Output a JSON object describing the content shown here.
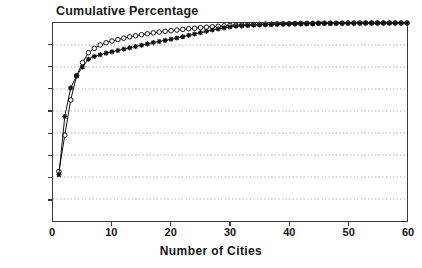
{
  "chart_data": {
    "type": "line",
    "title": "Cumulative Percentage",
    "xlabel": "Number of Cities",
    "ylabel": "",
    "xlim": [
      0,
      60
    ],
    "ylim": [
      10,
      100
    ],
    "grid": true,
    "legend_position": "none",
    "x_ticks": [
      0,
      10,
      20,
      30,
      40,
      50,
      60
    ],
    "x_tick_labels": [
      "0",
      "10",
      "20",
      "30",
      "40",
      "50",
      "60"
    ],
    "y_ticks": [
      10,
      20,
      30,
      40,
      50,
      60,
      70,
      80,
      90,
      100
    ],
    "y_tick_labels": [
      "10%",
      "20%",
      "30%",
      "40%",
      "50%",
      "60%",
      "70%",
      "80%",
      "90%",
      "100%"
    ],
    "x": [
      1,
      2,
      3,
      4,
      5,
      6,
      7,
      8,
      9,
      10,
      11,
      12,
      13,
      14,
      15,
      16,
      17,
      18,
      19,
      20,
      21,
      22,
      23,
      24,
      25,
      26,
      27,
      28,
      29,
      30,
      31,
      32,
      33,
      34,
      35,
      36,
      37,
      38,
      39,
      40,
      41,
      42,
      43,
      44,
      45,
      46,
      47,
      48,
      49,
      50,
      51,
      52,
      53,
      54,
      55,
      56,
      57,
      58,
      59,
      60
    ],
    "series": [
      {
        "name": "series-circles",
        "marker": "open-circle",
        "color": "#111111",
        "values": [
          32.5,
          49.0,
          65.0,
          76.0,
          82.0,
          86.5,
          88.5,
          90.0,
          91.0,
          91.8,
          92.5,
          93.1,
          93.7,
          94.2,
          94.7,
          95.1,
          95.5,
          95.9,
          96.2,
          96.5,
          96.8,
          97.1,
          97.4,
          97.6,
          97.9,
          98.1,
          98.3,
          98.5,
          98.7,
          98.9,
          99.0,
          99.1,
          99.2,
          99.3,
          99.4,
          99.5,
          99.5,
          99.6,
          99.6,
          99.7,
          99.7,
          99.8,
          99.8,
          99.8,
          99.9,
          99.9,
          99.9,
          99.9,
          99.9,
          100.0,
          100.0,
          100.0,
          100.0,
          100.0,
          100.0,
          100.0,
          100.0,
          100.0,
          100.0,
          100.0
        ]
      },
      {
        "name": "series-stars",
        "marker": "star-plus",
        "color": "#111111",
        "values": [
          31.0,
          57.5,
          70.5,
          76.0,
          80.0,
          83.5,
          84.8,
          85.6,
          86.3,
          86.9,
          87.5,
          88.1,
          88.7,
          89.3,
          89.9,
          90.5,
          91.1,
          91.6,
          92.1,
          92.6,
          93.2,
          93.8,
          94.4,
          95.0,
          95.6,
          96.2,
          96.8,
          97.3,
          97.8,
          98.2,
          98.5,
          98.7,
          98.9,
          99.0,
          99.1,
          99.2,
          99.3,
          99.4,
          99.5,
          99.5,
          99.6,
          99.6,
          99.7,
          99.7,
          99.8,
          99.8,
          99.8,
          99.9,
          99.9,
          99.9,
          99.9,
          99.9,
          100.0,
          100.0,
          100.0,
          100.0,
          100.0,
          100.0,
          100.0,
          100.0
        ]
      }
    ]
  },
  "figure": {
    "background": "#ffffff",
    "axis_color": "#3a3a3a",
    "grid_color": "#9a9a9a",
    "text_color": "#141414"
  }
}
